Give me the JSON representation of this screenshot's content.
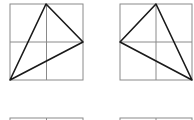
{
  "figures": [
    {
      "id": "A",
      "box": {
        "x": 10,
        "y": 4,
        "w": 73,
        "h": 76
      },
      "triangle": [
        [
          46,
          4
        ],
        [
          83,
          42
        ],
        [
          10,
          80
        ]
      ]
    },
    {
      "id": "B",
      "box": {
        "x": 120,
        "y": 4,
        "w": 72,
        "h": 76
      },
      "triangle": [
        [
          156,
          4
        ],
        [
          120,
          42
        ],
        [
          192,
          80
        ]
      ]
    },
    {
      "id": "C",
      "box": {
        "x": 10,
        "y": 118,
        "w": 73,
        "h": 76
      },
      "triangle": []
    },
    {
      "id": "D",
      "box": {
        "x": 120,
        "y": 118,
        "w": 72,
        "h": 76
      },
      "triangle": []
    }
  ],
  "colors": {
    "grid": "#8a8a8a",
    "triangle": "#1a1a1a",
    "background": "#ffffff"
  }
}
